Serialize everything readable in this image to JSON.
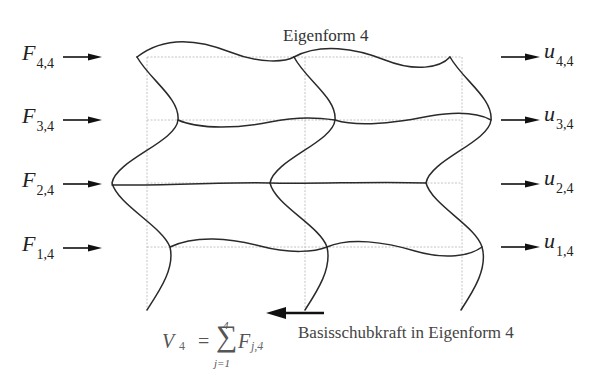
{
  "title": "Eigenform 4",
  "mode_number": 4,
  "forces": [
    {
      "symbol": "F",
      "sub": "4,4",
      "floor": 4
    },
    {
      "symbol": "F",
      "sub": "3,4",
      "floor": 3
    },
    {
      "symbol": "F",
      "sub": "2,4",
      "floor": 2
    },
    {
      "symbol": "F",
      "sub": "1,4",
      "floor": 1
    }
  ],
  "displacements": [
    {
      "symbol": "u",
      "sub": "4,4",
      "floor": 4
    },
    {
      "symbol": "u",
      "sub": "3,4",
      "floor": 3
    },
    {
      "symbol": "u",
      "sub": "2,4",
      "floor": 2
    },
    {
      "symbol": "u",
      "sub": "1,4",
      "floor": 1
    }
  ],
  "base_shear": {
    "lhs_symbol": "V",
    "lhs_sub": "4",
    "equals": "=",
    "sum_upper": "4",
    "sum_lower": "j=1",
    "sum_sign": "∑",
    "term_symbol": "F",
    "term_sub": "j,4",
    "caption": "Basisschubkraft in Eigenform 4"
  },
  "frame": {
    "bays": 2,
    "stories": 4,
    "undeformed_style": "dotted-gray",
    "deformed_style": "solid-dark"
  },
  "colors": {
    "deformed_line": "#2a2a2a",
    "grid_line": "#bdbdbd",
    "arrow": "#111111",
    "text": "#222222"
  }
}
